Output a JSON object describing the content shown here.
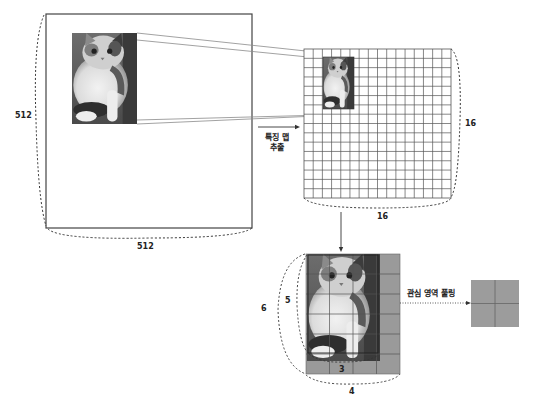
{
  "diagram": {
    "input_image": {
      "width_label": "512",
      "height_label": "512"
    },
    "feature_map": {
      "width_label": "16",
      "height_label": "16",
      "grid_cols": 16,
      "grid_rows": 16
    },
    "arrow_extract": {
      "label_line1": "특징 맵",
      "label_line2": "추출"
    },
    "roi": {
      "outer_width_label": "4",
      "outer_height_label": "6",
      "inner_width_label": "3",
      "inner_height_label": "5",
      "grid_cols": 4,
      "grid_rows": 6
    },
    "arrow_pool": {
      "label": "관심 영역 풀링"
    },
    "pooled_output": {
      "grid_cols": 2,
      "grid_rows": 2
    },
    "colors": {
      "line": "#555555",
      "grid_line": "#444444",
      "roi_gray": "#9a9a9a",
      "pooled_gray": "#9c9c9c",
      "guide_line": "#8a8a8a"
    }
  }
}
